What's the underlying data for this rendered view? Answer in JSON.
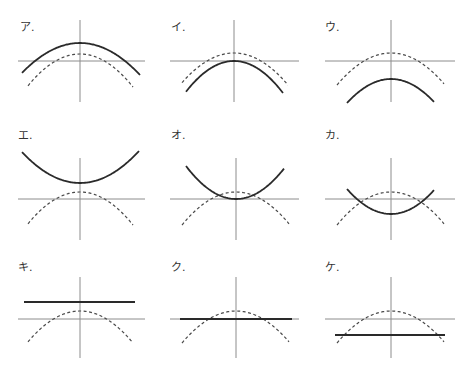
{
  "colors": {
    "axis": "#8c8c8c",
    "solid": "#2a2a2a",
    "dashed": "#4a4a4a",
    "label": "#333333"
  },
  "panels": [
    {
      "label": "ア.",
      "label_pos": [
        20,
        22
      ],
      "origin": [
        80,
        61
      ],
      "xaxis": [
        18,
        145
      ],
      "yaxis": [
        20,
        102
      ],
      "dashed": {
        "type": "parabola",
        "vertex_y": 54,
        "x0": 28,
        "x1": 133,
        "end_y": 87
      },
      "solid": {
        "type": "parabola",
        "vertex_y": 43,
        "x0": 22,
        "x1": 140,
        "end_y": 75
      }
    },
    {
      "label": "イ.",
      "label_pos": [
        171,
        22
      ],
      "origin": [
        234,
        61
      ],
      "xaxis": [
        170,
        299
      ],
      "yaxis": [
        20,
        102
      ],
      "dashed": {
        "type": "parabola",
        "vertex_y": 53,
        "x0": 182,
        "x1": 288,
        "end_y": 85
      },
      "solid": {
        "type": "parabola",
        "vertex_y": 61,
        "x0": 186,
        "x1": 283,
        "end_y": 93
      }
    },
    {
      "label": "ウ.",
      "label_pos": [
        325,
        22
      ],
      "origin": [
        391,
        61
      ],
      "xaxis": [
        325,
        455
      ],
      "yaxis": [
        20,
        102
      ],
      "dashed": {
        "type": "parabola",
        "vertex_y": 53,
        "x0": 337,
        "x1": 444,
        "end_y": 85
      },
      "solid": {
        "type": "parabola",
        "vertex_y": 79,
        "x0": 347,
        "x1": 434,
        "end_y": 103
      }
    },
    {
      "label": "エ.",
      "label_pos": [
        18,
        130
      ],
      "origin": [
        80,
        199
      ],
      "xaxis": [
        18,
        145
      ],
      "yaxis": [
        158,
        240
      ],
      "dashed": {
        "type": "parabola",
        "vertex_y": 192,
        "x0": 28,
        "x1": 133,
        "end_y": 225
      },
      "solid": {
        "type": "parabola",
        "vertex_y": 183,
        "x0": 22,
        "x1": 139,
        "end_y": 151
      }
    },
    {
      "label": "オ.",
      "label_pos": [
        171,
        130
      ],
      "origin": [
        236,
        199
      ],
      "xaxis": [
        170,
        299
      ],
      "yaxis": [
        158,
        240
      ],
      "dashed": {
        "type": "parabola",
        "vertex_y": 192,
        "x0": 182,
        "x1": 289,
        "end_y": 225
      },
      "solid": {
        "type": "parabola",
        "vertex_y": 199,
        "x0": 186,
        "x1": 284,
        "end_y": 166
      }
    },
    {
      "label": "カ.",
      "label_pos": [
        325,
        130
      ],
      "origin": [
        391,
        199
      ],
      "xaxis": [
        325,
        455
      ],
      "yaxis": [
        158,
        240
      ],
      "dashed": {
        "type": "parabola",
        "vertex_y": 192,
        "x0": 337,
        "x1": 444,
        "end_y": 225
      },
      "solid": {
        "type": "parabola",
        "vertex_y": 214,
        "x0": 347,
        "x1": 434,
        "end_y": 189
      }
    },
    {
      "label": "キ.",
      "label_pos": [
        18,
        262
      ],
      "origin": [
        80,
        319
      ],
      "xaxis": [
        18,
        145
      ],
      "yaxis": [
        277,
        358
      ],
      "dashed": {
        "type": "parabola",
        "vertex_y": 311,
        "x0": 28,
        "x1": 133,
        "end_y": 343
      },
      "solid": {
        "type": "line",
        "y": 302,
        "x0": 24,
        "x1": 135
      }
    },
    {
      "label": "ク.",
      "label_pos": [
        171,
        262
      ],
      "origin": [
        236,
        319
      ],
      "xaxis": [
        170,
        299
      ],
      "yaxis": [
        277,
        358
      ],
      "dashed": {
        "type": "parabola",
        "vertex_y": 311,
        "x0": 182,
        "x1": 289,
        "end_y": 343
      },
      "solid": {
        "type": "line",
        "y": 319,
        "x0": 180,
        "x1": 292
      }
    },
    {
      "label": "ケ.",
      "label_pos": [
        325,
        262
      ],
      "origin": [
        391,
        319
      ],
      "xaxis": [
        325,
        455
      ],
      "yaxis": [
        277,
        358
      ],
      "dashed": {
        "type": "parabola",
        "vertex_y": 311,
        "x0": 337,
        "x1": 444,
        "end_y": 343
      },
      "solid": {
        "type": "line",
        "y": 335,
        "x0": 335,
        "x1": 445
      }
    }
  ]
}
